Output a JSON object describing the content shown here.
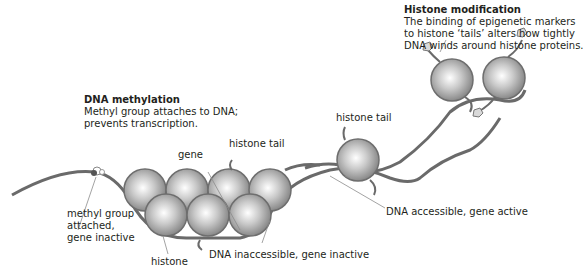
{
  "diagram": {
    "colors": {
      "histone_light": "#f2f2f2",
      "histone_dark": "#8a8a8a",
      "histone_outline": "#6e6e6e",
      "dna_strand": "#6a6a6a",
      "text": "#231f20",
      "leader_line": "#8c8c8c"
    },
    "callouts": {
      "dna_methylation": {
        "title": "DNA methylation",
        "line1": "Methyl group attaches to DNA;",
        "line2": "prevents transcription."
      },
      "histone_modification": {
        "title": "Histone modification",
        "line1": "The binding of epigenetic markers",
        "line2": "to histone ‘tails’ alters how tightly",
        "line3": "DNA winds around histone proteins."
      }
    },
    "labels": {
      "gene": "gene",
      "histone_tail_left": "histone tail",
      "histone_tail_right": "histone tail",
      "methyl_line1": "methyl group",
      "methyl_line2": "attached,",
      "methyl_line3": "gene inactive",
      "histone": "histone",
      "dna_inaccessible": "DNA inaccessible, gene inactive",
      "dna_accessible": "DNA accessible, gene active"
    }
  }
}
